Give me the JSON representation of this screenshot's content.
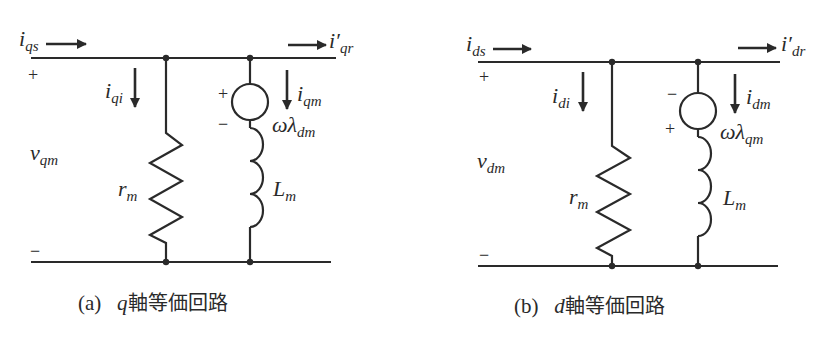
{
  "figure": {
    "panels": [
      {
        "id": "a",
        "caption": {
          "index": "(a)",
          "axis": "q",
          "text": "軸等価回路"
        },
        "labels": {
          "input_current": {
            "base": "i",
            "sub": "qs"
          },
          "output_current": {
            "base": "i′",
            "sub": "qr"
          },
          "voltage": {
            "base": "v",
            "sub": "qm"
          },
          "core_loss_current": {
            "base": "i",
            "sub": "qi"
          },
          "magnetizing_current": {
            "base": "i",
            "sub": "qm"
          },
          "speed_voltage": {
            "base": "ωλ",
            "sub": "dm"
          },
          "resistor": {
            "base": "r",
            "sub": "m"
          },
          "inductor": {
            "base": "L",
            "sub": "m"
          }
        },
        "polarity": {
          "terminal_top": "+",
          "terminal_bottom": "−",
          "source_top": "+",
          "source_bottom": "−"
        }
      },
      {
        "id": "b",
        "caption": {
          "index": "(b)",
          "axis": "d",
          "text": "軸等価回路"
        },
        "labels": {
          "input_current": {
            "base": "i",
            "sub": "ds"
          },
          "output_current": {
            "base": "i′",
            "sub": "dr"
          },
          "voltage": {
            "base": "v",
            "sub": "dm"
          },
          "core_loss_current": {
            "base": "i",
            "sub": "di"
          },
          "magnetizing_current": {
            "base": "i",
            "sub": "dm"
          },
          "speed_voltage": {
            "base": "ωλ",
            "sub": "qm"
          },
          "resistor": {
            "base": "r",
            "sub": "m"
          },
          "inductor": {
            "base": "L",
            "sub": "m"
          }
        },
        "polarity": {
          "terminal_top": "+",
          "terminal_bottom": "−",
          "source_top": "−",
          "source_bottom": "+"
        }
      }
    ],
    "colors": {
      "stroke": "#2a2a2a",
      "background": "#ffffff"
    }
  }
}
